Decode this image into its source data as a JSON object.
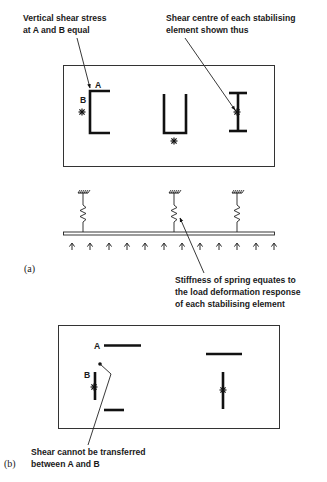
{
  "part_a": {
    "label": "(a)",
    "annotations": {
      "shear_stress_line1": "Vertical shear stress",
      "shear_stress_line2": "at A and B equal",
      "shear_centre_line1": "Shear centre of each stabilising",
      "shear_centre_line2": "element shown thus",
      "spring_line1": "Stiffness of spring equates to",
      "spring_line2": "the load deformation response",
      "spring_line3": "of each stabilising element"
    },
    "point_labels": {
      "a": "A",
      "b": "B"
    },
    "elements": [
      "channel-section",
      "u-section",
      "i-section"
    ],
    "springs_count": 3,
    "load_arrows_count": 12
  },
  "part_b": {
    "label": "(b)",
    "annotations": {
      "shear_line1": "Shear cannot be transferred",
      "shear_line2": "between A and B"
    },
    "point_labels": {
      "a": "A",
      "b": "B"
    },
    "elements": [
      "open-channel-separated",
      "open-tee-separated"
    ]
  },
  "colors": {
    "ink": "#111111",
    "background": "#ffffff"
  }
}
